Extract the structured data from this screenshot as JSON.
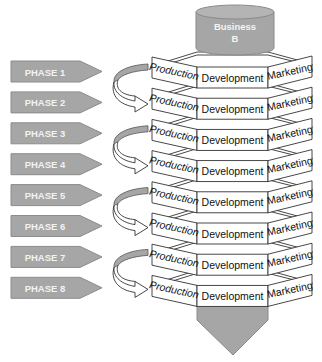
{
  "diagram": {
    "top_cylinder": {
      "line1": "Business",
      "line2": "B"
    },
    "phases": [
      {
        "label": "PHASE 1"
      },
      {
        "label": "PHASE 2"
      },
      {
        "label": "PHASE 3"
      },
      {
        "label": "PHASE 4"
      },
      {
        "label": "PHASE 5"
      },
      {
        "label": "PHASE 6"
      },
      {
        "label": "PHASE 7"
      },
      {
        "label": "PHASE 8"
      }
    ],
    "tiers": [
      {
        "left": "Production",
        "front": "Development",
        "right": "Marketing"
      },
      {
        "left": "Production",
        "front": "Development",
        "right": "Marketing"
      },
      {
        "left": "Production",
        "front": "Development",
        "right": "Marketing"
      },
      {
        "left": "Production",
        "front": "Development",
        "right": "Marketing"
      },
      {
        "left": "Production",
        "front": "Development",
        "right": "Marketing"
      },
      {
        "left": "Production",
        "front": "Development",
        "right": "Marketing"
      },
      {
        "left": "Production",
        "front": "Development",
        "right": "Marketing"
      },
      {
        "left": "Production",
        "front": "Development",
        "right": "Marketing"
      }
    ],
    "curved_arrows": [
      {
        "from_phase": 1,
        "to_phase": 2
      },
      {
        "from_phase": 3,
        "to_phase": 4
      },
      {
        "from_phase": 5,
        "to_phase": 6
      },
      {
        "from_phase": 7,
        "to_phase": 8
      }
    ],
    "colors": {
      "shape_fill": "#a6a6a6",
      "shape_stroke": "#7f7f7f",
      "outline": "#333333",
      "face_fill": "#ffffff",
      "label_light": "#f2f2f2"
    }
  }
}
